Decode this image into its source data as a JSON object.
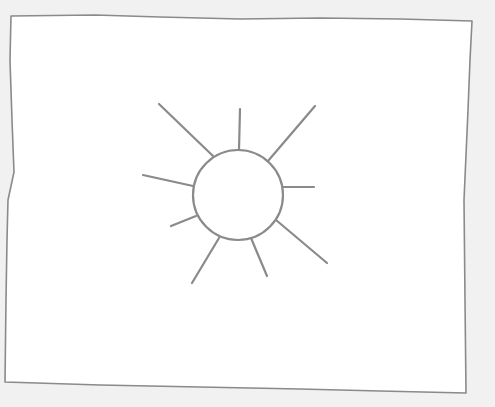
{
  "canvas": {
    "width": 495,
    "height": 407,
    "background": "#f1f1f1"
  },
  "sketch": {
    "subject": "sun",
    "stroke_color": "#8a8a8a",
    "fill_color": "#ffffff",
    "frame": {
      "points": "11,16 95,15 160,17 240,19 320,18 400,19 472,21 470,60 468,110 464,200 465,300 466,393 380,391 300,389 200,387 100,385 5,382 6,300 7,240 8,200 14,172 12,120 10,60"
    },
    "sun": {
      "cx": 238,
      "cy": 195,
      "r": 45,
      "rays": [
        {
          "x1": 213,
          "y1": 156,
          "x2": 159,
          "y2": 104
        },
        {
          "x1": 239,
          "y1": 150,
          "x2": 240,
          "y2": 109
        },
        {
          "x1": 268,
          "y1": 161,
          "x2": 315,
          "y2": 106
        },
        {
          "x1": 283,
          "y1": 187,
          "x2": 314,
          "y2": 187
        },
        {
          "x1": 193,
          "y1": 186,
          "x2": 143,
          "y2": 175
        },
        {
          "x1": 196,
          "y1": 216,
          "x2": 171,
          "y2": 226
        },
        {
          "x1": 219,
          "y1": 238,
          "x2": 192,
          "y2": 283
        },
        {
          "x1": 251,
          "y1": 238,
          "x2": 267,
          "y2": 276
        },
        {
          "x1": 276,
          "y1": 220,
          "x2": 327,
          "y2": 263
        }
      ]
    }
  }
}
